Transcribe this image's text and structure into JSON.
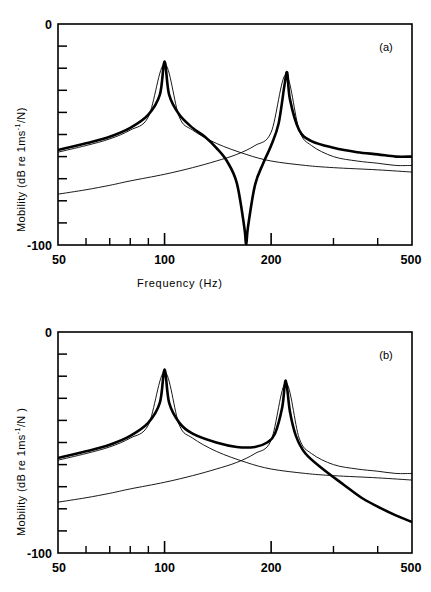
{
  "figure": {
    "panels": [
      {
        "id": "a",
        "tag": "(a)",
        "ylabel_parts": {
          "pre": "Mobility (dB re 1ms",
          "sup": "-1",
          "post": "/N)"
        },
        "xlabel": "Frequency  (Hz)",
        "show_xlabel": true
      },
      {
        "id": "b",
        "tag": "(b)",
        "ylabel_parts": {
          "pre": "Mobility  (dB re 1ms",
          "sup": "-1",
          "post": "/N )"
        },
        "xlabel": "",
        "show_xlabel": false
      }
    ]
  },
  "axes": {
    "x_tick_labels": {
      "t50": "50",
      "t100": "100",
      "t200": "200",
      "t500": "500"
    },
    "y_tick_labels": {
      "top": "0",
      "bottom": "-100"
    }
  },
  "chart_data": {
    "type": "line",
    "title": "",
    "xlabel": "Frequency (Hz)",
    "ylabel": "Mobility (dB re 1ms-1/N)",
    "xscale": "log",
    "yscale": "linear",
    "xlim": [
      50,
      500
    ],
    "ylim": [
      -100,
      0
    ],
    "x_ticks_major": [
      50,
      100,
      200,
      500
    ],
    "x_ticks_minor": [
      60,
      70,
      80,
      90,
      300,
      400
    ],
    "y_ticks": [
      0,
      -10,
      -20,
      -30,
      -40,
      -50,
      -60,
      -70,
      -80,
      -90,
      -100
    ],
    "grid": false,
    "legend": "none",
    "panels": [
      {
        "id": "a",
        "annotation": "(a)",
        "resonances_hz": [
          100,
          220
        ],
        "antiresonance_hz": 170,
        "series": [
          {
            "name": "total-mobility",
            "style": "thick",
            "comment": "sum of two modal terms, same sign-opposition giving antiresonance notch at 170 Hz",
            "points_hz_db": [
              [
                50,
                -57
              ],
              [
                60,
                -54
              ],
              [
                70,
                -51
              ],
              [
                80,
                -47
              ],
              [
                90,
                -41
              ],
              [
                97,
                -32
              ],
              [
                100,
                -17
              ],
              [
                103,
                -32
              ],
              [
                110,
                -41
              ],
              [
                120,
                -47
              ],
              [
                130,
                -51
              ],
              [
                140,
                -56
              ],
              [
                150,
                -62
              ],
              [
                160,
                -72
              ],
              [
                168,
                -92
              ],
              [
                170,
                -100
              ],
              [
                172,
                -92
              ],
              [
                180,
                -73
              ],
              [
                190,
                -63
              ],
              [
                200,
                -55
              ],
              [
                210,
                -45
              ],
              [
                218,
                -28
              ],
              [
                222,
                -22
              ],
              [
                226,
                -34
              ],
              [
                240,
                -48
              ],
              [
                260,
                -53
              ],
              [
                300,
                -56
              ],
              [
                350,
                -58
              ],
              [
                400,
                -59
              ],
              [
                450,
                -60
              ],
              [
                500,
                -60
              ]
            ]
          },
          {
            "name": "mode-1-component",
            "style": "thin",
            "comment": "first mode alone, peak 100 Hz, rolls off to the right",
            "points_hz_db": [
              [
                50,
                -58
              ],
              [
                60,
                -55
              ],
              [
                70,
                -52
              ],
              [
                80,
                -48
              ],
              [
                90,
                -42
              ],
              [
                100,
                -18
              ],
              [
                110,
                -42
              ],
              [
                120,
                -48
              ],
              [
                140,
                -54
              ],
              [
                170,
                -59
              ],
              [
                200,
                -62
              ],
              [
                250,
                -64
              ],
              [
                300,
                -65
              ],
              [
                400,
                -66
              ],
              [
                500,
                -67
              ]
            ]
          },
          {
            "name": "mode-2-component",
            "style": "thin",
            "comment": "second mode alone, peak 220 Hz, low at left edge",
            "points_hz_db": [
              [
                50,
                -77
              ],
              [
                60,
                -75
              ],
              [
                70,
                -73
              ],
              [
                80,
                -71
              ],
              [
                100,
                -68
              ],
              [
                120,
                -65
              ],
              [
                140,
                -62
              ],
              [
                160,
                -59
              ],
              [
                180,
                -55
              ],
              [
                200,
                -49
              ],
              [
                220,
                -23
              ],
              [
                240,
                -48
              ],
              [
                260,
                -55
              ],
              [
                300,
                -60
              ],
              [
                350,
                -62
              ],
              [
                400,
                -63
              ],
              [
                450,
                -64
              ],
              [
                500,
                -64
              ]
            ]
          }
        ]
      },
      {
        "id": "b",
        "annotation": "(b)",
        "resonances_hz": [
          100,
          220
        ],
        "antiresonance_hz": null,
        "series": [
          {
            "name": "total-mobility",
            "style": "thick",
            "comment": "modal terms add in phase, no antiresonance; steep roll-off above 220 Hz",
            "points_hz_db": [
              [
                50,
                -57
              ],
              [
                60,
                -54
              ],
              [
                70,
                -51
              ],
              [
                80,
                -47
              ],
              [
                90,
                -41
              ],
              [
                97,
                -32
              ],
              [
                100,
                -17
              ],
              [
                103,
                -32
              ],
              [
                110,
                -41
              ],
              [
                120,
                -46
              ],
              [
                140,
                -50
              ],
              [
                160,
                -52
              ],
              [
                180,
                -52
              ],
              [
                195,
                -50
              ],
              [
                205,
                -46
              ],
              [
                215,
                -34
              ],
              [
                220,
                -22
              ],
              [
                226,
                -36
              ],
              [
                235,
                -47
              ],
              [
                250,
                -55
              ],
              [
                280,
                -62
              ],
              [
                320,
                -69
              ],
              [
                360,
                -75
              ],
              [
                400,
                -79
              ],
              [
                450,
                -83
              ],
              [
                500,
                -86
              ]
            ]
          },
          {
            "name": "mode-1-component",
            "style": "thin",
            "comment": "first mode alone, peak 100 Hz",
            "points_hz_db": [
              [
                50,
                -58
              ],
              [
                60,
                -55
              ],
              [
                70,
                -52
              ],
              [
                80,
                -48
              ],
              [
                90,
                -42
              ],
              [
                100,
                -18
              ],
              [
                110,
                -42
              ],
              [
                120,
                -48
              ],
              [
                140,
                -54
              ],
              [
                170,
                -59
              ],
              [
                200,
                -62
              ],
              [
                250,
                -64
              ],
              [
                300,
                -65
              ],
              [
                400,
                -66
              ],
              [
                500,
                -67
              ]
            ]
          },
          {
            "name": "mode-2-component",
            "style": "thin",
            "comment": "second mode alone, peak 220 Hz",
            "points_hz_db": [
              [
                50,
                -77
              ],
              [
                60,
                -75
              ],
              [
                70,
                -73
              ],
              [
                80,
                -71
              ],
              [
                100,
                -68
              ],
              [
                120,
                -65
              ],
              [
                140,
                -62
              ],
              [
                160,
                -59
              ],
              [
                180,
                -55
              ],
              [
                200,
                -49
              ],
              [
                220,
                -23
              ],
              [
                240,
                -48
              ],
              [
                260,
                -55
              ],
              [
                300,
                -60
              ],
              [
                350,
                -62
              ],
              [
                400,
                -63
              ],
              [
                450,
                -64
              ],
              [
                500,
                -64
              ]
            ]
          }
        ]
      }
    ]
  }
}
